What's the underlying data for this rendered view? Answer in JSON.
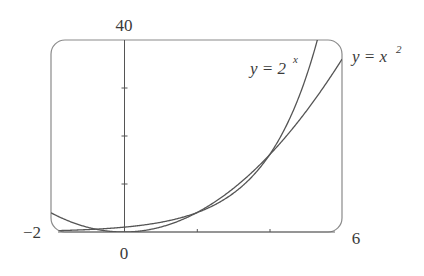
{
  "chart_data": {
    "type": "line",
    "title": "",
    "xlabel": "",
    "ylabel": "",
    "xlim": [
      -2,
      6
    ],
    "ylim": [
      0,
      40
    ],
    "x_tick_labels": [
      "-2",
      "0",
      "6"
    ],
    "y_tick_labels": [
      "40"
    ],
    "x_ticks": [
      2,
      4
    ],
    "y_ticks": [
      10,
      20,
      30
    ],
    "grid": false,
    "legend_position": "inline labels at top right",
    "series": [
      {
        "name": "y = 2^x",
        "function": "2^x",
        "x": [
          -2,
          -1,
          0,
          1,
          2,
          3,
          4,
          5,
          5.32
        ],
        "values": [
          0.25,
          0.5,
          1,
          2,
          4,
          8,
          16,
          32,
          40
        ]
      },
      {
        "name": "y = x^2",
        "function": "x^2",
        "x": [
          -2,
          -1,
          0,
          1,
          2,
          3,
          4,
          5,
          6
        ],
        "values": [
          4,
          1,
          0,
          1,
          4,
          9,
          16,
          25,
          36
        ]
      }
    ],
    "colors": {
      "curves": "#555555",
      "frame": "#777777",
      "axes": "#555555"
    }
  },
  "labels": {
    "y_max": "40",
    "x_min": "−2",
    "x_zero": "0",
    "x_max": "6",
    "exp_label_base": "y = 2",
    "exp_label_sup": "x",
    "sq_label_base": "y = x",
    "sq_label_sup": "2"
  }
}
